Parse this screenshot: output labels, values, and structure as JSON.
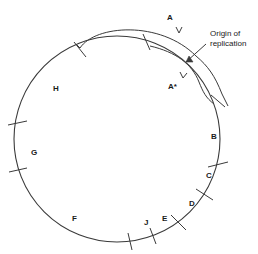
{
  "figure": {
    "type": "circular-genome-map",
    "background_color": "#ffffff",
    "stroke_color": "#3a3a3a",
    "text_color": "#1a1a1a"
  },
  "circle": {
    "center_x": 117,
    "center_y": 139,
    "radius": 103
  },
  "segments": [
    {
      "id": "A",
      "label": "A",
      "x": 167,
      "y": 14
    },
    {
      "id": "Astar",
      "label": "A*",
      "x": 168,
      "y": 83
    },
    {
      "id": "B",
      "label": "B",
      "x": 211,
      "y": 133
    },
    {
      "id": "C",
      "label": "C",
      "x": 206,
      "y": 172
    },
    {
      "id": "D",
      "label": "D",
      "x": 189,
      "y": 200
    },
    {
      "id": "E",
      "label": "E",
      "x": 162,
      "y": 215
    },
    {
      "id": "J",
      "label": "J",
      "x": 144,
      "y": 219
    },
    {
      "id": "F",
      "label": "F",
      "x": 72,
      "y": 215
    },
    {
      "id": "G",
      "label": "G",
      "x": 31,
      "y": 149
    },
    {
      "id": "H",
      "label": "H",
      "x": 53,
      "y": 85
    }
  ],
  "annotations": [
    {
      "id": "origin-of-replication",
      "line1": "Origin of",
      "line2": "replication",
      "x": 210,
      "y": 29
    }
  ],
  "ticks": [
    {
      "id": "tick-top-left",
      "angle_deg": 249
    },
    {
      "id": "tick-top-center",
      "angle_deg": 272
    },
    {
      "id": "tick-right-upper",
      "angle_deg": 340
    },
    {
      "id": "tick-right-c",
      "angle_deg": 22
    },
    {
      "id": "tick-right-d",
      "angle_deg": 37
    },
    {
      "id": "tick-bottom-e",
      "angle_deg": 54
    },
    {
      "id": "tick-bottom-j1",
      "angle_deg": 72
    },
    {
      "id": "tick-bottom-j2",
      "angle_deg": 85
    },
    {
      "id": "tick-left-upper",
      "angle_deg": 190
    },
    {
      "id": "tick-left-lower",
      "angle_deg": 167
    }
  ]
}
